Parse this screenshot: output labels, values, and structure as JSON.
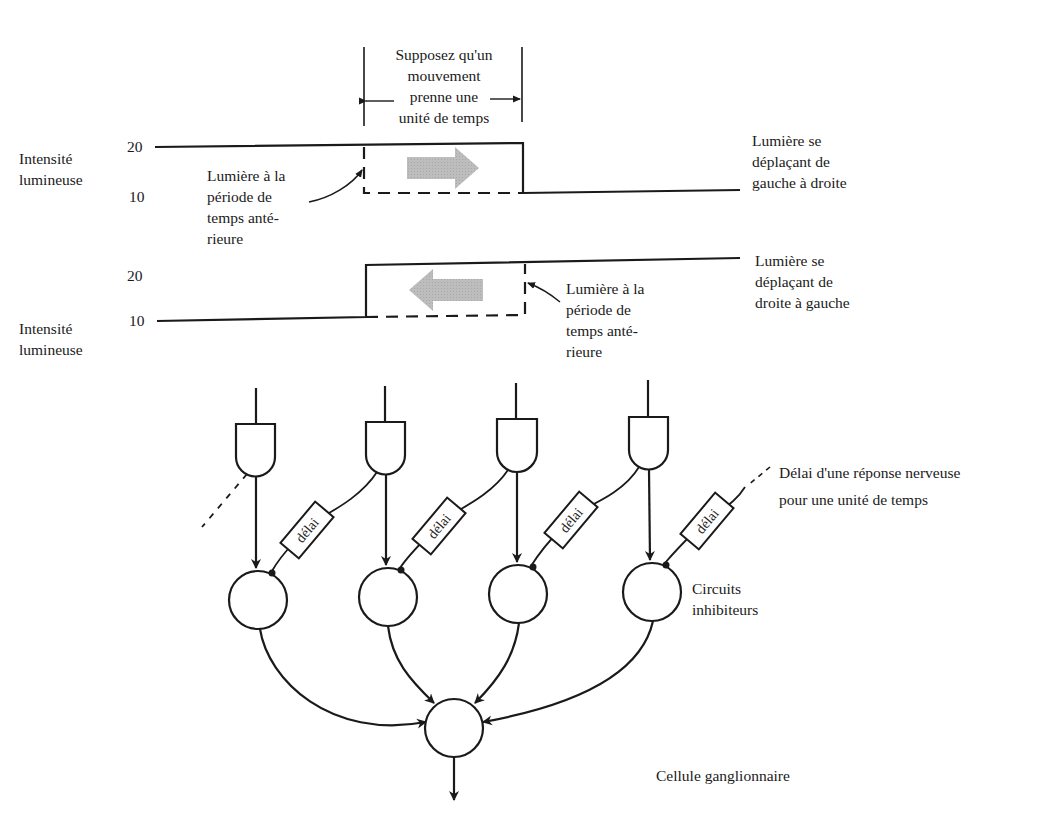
{
  "top_waveform": {
    "y_axis_label": [
      "Intensité",
      "lumineuse"
    ],
    "tick_high": "20",
    "tick_low": "10",
    "duration_note": [
      "Supposez qu'un",
      "mouvement",
      "prenne une",
      "unité de temps"
    ],
    "previous_light_note": [
      "Lumière à la",
      "période de",
      "temps anté-",
      "rieure"
    ],
    "direction_label": [
      "Lumière se",
      "déplaçant de",
      "gauche à droite"
    ],
    "arrow_direction": "right"
  },
  "bottom_waveform": {
    "y_axis_label": [
      "Intensité",
      "lumineuse"
    ],
    "tick_high": "20",
    "tick_low": "10",
    "previous_light_note": [
      "Lumière à la",
      "période de",
      "temps anté-",
      "rieure"
    ],
    "direction_label": [
      "Lumière se",
      "déplaçant de",
      "droite à gauche"
    ],
    "arrow_direction": "left"
  },
  "circuit": {
    "gate_count": 4,
    "delay_label": "délai",
    "delay_note": [
      "Délai d'une réponse nerveuse",
      "pour une unité de temps"
    ],
    "inhibitory_label": [
      "Circuits",
      "inhibiteurs"
    ],
    "ganglion_label": "Cellule ganglionnaire"
  },
  "colors": {
    "ink": "#1a1a1a",
    "arrow_fill": "#b8b8b8",
    "background": "#ffffff"
  }
}
